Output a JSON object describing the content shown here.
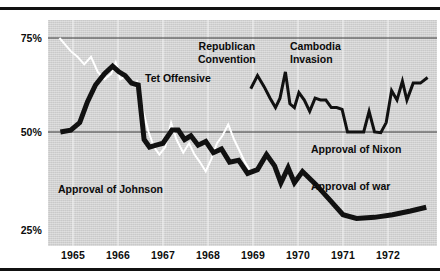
{
  "figure": {
    "title": "",
    "background_color": "#ffffff",
    "plot_background_color": "#d4d4d4"
  },
  "chart_data": {
    "type": "line",
    "title": "",
    "subtitle": "",
    "xlabel": "",
    "ylabel": "",
    "xlim": [
      1964.6,
      1972.9
    ],
    "ylim": [
      22,
      80
    ],
    "grid": true,
    "grid_style": "horizontal gridlines at 50% and 75%; faint white vertical lines at each year",
    "legend_position": "inline labels on plot",
    "y_ticks": [
      {
        "value": 25,
        "label": "25%"
      },
      {
        "value": 50,
        "label": "50%"
      },
      {
        "value": 75,
        "label": "75%"
      }
    ],
    "x_ticks": [
      {
        "value": 1965,
        "label": "1965"
      },
      {
        "value": 1966,
        "label": "1966"
      },
      {
        "value": 1967,
        "label": "1967"
      },
      {
        "value": 1968,
        "label": "1968"
      },
      {
        "value": 1969,
        "label": "1969"
      },
      {
        "value": 1970,
        "label": "1970"
      },
      {
        "value": 1971,
        "label": "1971"
      },
      {
        "value": 1972,
        "label": "1972"
      }
    ],
    "series": [
      {
        "name": "Approval of Johnson",
        "color": "#ffffff",
        "stroke_width": 2,
        "label_text": "Approval of Johnson",
        "points": [
          [
            1964.7,
            75.0
          ],
          [
            1964.95,
            71.5
          ],
          [
            1965.1,
            70.0
          ],
          [
            1965.25,
            68.0
          ],
          [
            1965.4,
            70.0
          ],
          [
            1965.55,
            66.0
          ],
          [
            1965.7,
            64.0
          ],
          [
            1965.85,
            65.5
          ],
          [
            1965.95,
            68.5
          ],
          [
            1966.05,
            64.0
          ],
          [
            1966.18,
            65.0
          ],
          [
            1966.3,
            63.0
          ],
          [
            1966.42,
            63.5
          ],
          [
            1966.55,
            56.0
          ],
          [
            1966.68,
            50.0
          ],
          [
            1966.8,
            46.0
          ],
          [
            1966.92,
            44.0
          ],
          [
            1967.05,
            46.0
          ],
          [
            1967.18,
            52.5
          ],
          [
            1967.3,
            48.0
          ],
          [
            1967.45,
            44.5
          ],
          [
            1967.58,
            47.0
          ],
          [
            1967.7,
            44.0
          ],
          [
            1967.82,
            42.0
          ],
          [
            1967.95,
            39.5
          ],
          [
            1968.08,
            43.0
          ],
          [
            1968.2,
            47.0
          ],
          [
            1968.32,
            49.0
          ],
          [
            1968.45,
            52.0
          ],
          [
            1968.58,
            48.0
          ],
          [
            1968.7,
            45.0
          ],
          [
            1968.82,
            42.0
          ],
          [
            1968.92,
            40.0
          ]
        ]
      },
      {
        "name": "Approval of war",
        "color": "#111111",
        "stroke_width": 5,
        "label_text": "Approval of war",
        "points": [
          [
            1964.72,
            50.0
          ],
          [
            1964.95,
            50.5
          ],
          [
            1965.15,
            52.5
          ],
          [
            1965.32,
            58.0
          ],
          [
            1965.5,
            62.5
          ],
          [
            1965.7,
            65.5
          ],
          [
            1965.88,
            67.5
          ],
          [
            1966.02,
            66.0
          ],
          [
            1966.16,
            65.0
          ],
          [
            1966.3,
            63.0
          ],
          [
            1966.45,
            62.5
          ],
          [
            1966.58,
            48.0
          ],
          [
            1966.7,
            46.0
          ],
          [
            1966.85,
            46.5
          ],
          [
            1967.0,
            47.0
          ],
          [
            1967.2,
            50.5
          ],
          [
            1967.34,
            50.5
          ],
          [
            1967.48,
            48.0
          ],
          [
            1967.62,
            49.0
          ],
          [
            1967.78,
            46.5
          ],
          [
            1967.95,
            47.5
          ],
          [
            1968.12,
            44.5
          ],
          [
            1968.3,
            45.5
          ],
          [
            1968.48,
            42.0
          ],
          [
            1968.68,
            42.5
          ],
          [
            1968.88,
            39.0
          ],
          [
            1969.1,
            40.0
          ],
          [
            1969.3,
            44.0
          ],
          [
            1969.48,
            41.0
          ],
          [
            1969.62,
            36.5
          ],
          [
            1969.78,
            40.5
          ],
          [
            1969.92,
            36.5
          ],
          [
            1970.1,
            39.5
          ],
          [
            1970.4,
            36.0
          ],
          [
            1970.7,
            32.0
          ],
          [
            1971.0,
            28.0
          ],
          [
            1971.3,
            27.0
          ],
          [
            1971.7,
            27.3
          ],
          [
            1972.1,
            28.0
          ],
          [
            1972.5,
            29.0
          ],
          [
            1972.85,
            30.0
          ]
        ]
      },
      {
        "name": "Approval of Nixon",
        "color": "#111111",
        "stroke_width": 3,
        "label_text": "Approval of Nixon",
        "points": [
          [
            1968.95,
            61.5
          ],
          [
            1969.1,
            65.0
          ],
          [
            1969.25,
            62.0
          ],
          [
            1969.38,
            59.0
          ],
          [
            1969.5,
            56.5
          ],
          [
            1969.6,
            59.0
          ],
          [
            1969.72,
            66.0
          ],
          [
            1969.82,
            57.5
          ],
          [
            1969.92,
            56.5
          ],
          [
            1970.02,
            60.5
          ],
          [
            1970.14,
            58.5
          ],
          [
            1970.26,
            55.5
          ],
          [
            1970.38,
            59.0
          ],
          [
            1970.5,
            58.5
          ],
          [
            1970.62,
            58.5
          ],
          [
            1970.74,
            56.5
          ],
          [
            1970.86,
            56.5
          ],
          [
            1970.98,
            56.0
          ],
          [
            1971.1,
            50.0
          ],
          [
            1971.28,
            50.0
          ],
          [
            1971.46,
            50.0
          ],
          [
            1971.58,
            55.5
          ],
          [
            1971.7,
            50.0
          ],
          [
            1971.84,
            49.8
          ],
          [
            1971.96,
            52.5
          ],
          [
            1972.08,
            61.0
          ],
          [
            1972.2,
            58.5
          ],
          [
            1972.32,
            63.5
          ],
          [
            1972.42,
            58.5
          ],
          [
            1972.56,
            63.0
          ],
          [
            1972.72,
            63.0
          ],
          [
            1972.88,
            64.5
          ]
        ]
      }
    ],
    "annotations": [
      {
        "id": "tet-offensive",
        "text": "Tet Offensive",
        "lines": [
          "Tet Offensive"
        ]
      },
      {
        "id": "republican-convention",
        "text": "Republican Convention",
        "lines": [
          "Republican",
          "Convention"
        ]
      },
      {
        "id": "cambodia-invasion",
        "text": "Cambodia Invasion",
        "lines": [
          "Cambodia",
          "Invasion"
        ]
      }
    ]
  }
}
